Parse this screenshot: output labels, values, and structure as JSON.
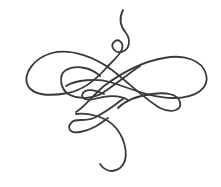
{
  "image": {
    "description": "Decorative calligraphic flourish ornament",
    "width": 221,
    "height": 187,
    "background": "#ffffff",
    "stroke_color": "#3a3a3a",
    "stroke_width": 1.8
  },
  "ornament": {
    "label": "Calligraphic swirl flourish",
    "elements": [
      "top-tail",
      "top-small-loop",
      "left-large-loop",
      "right-large-loop",
      "center-inner-loop",
      "center-small-loop",
      "lower-left-loop",
      "bottom-tail"
    ]
  }
}
